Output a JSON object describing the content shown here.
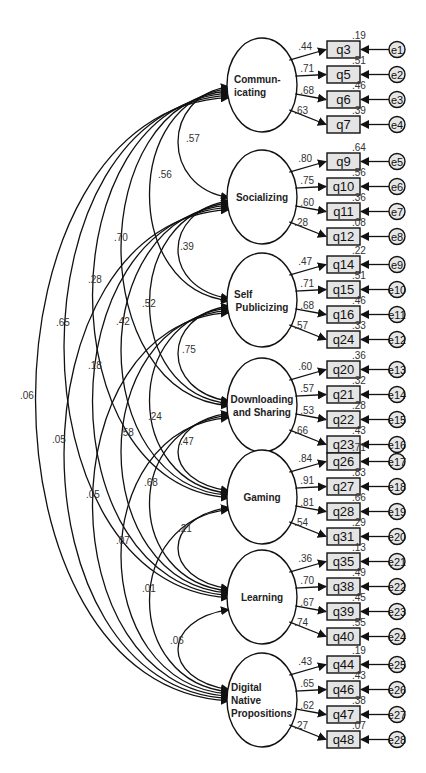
{
  "diagram": {
    "type": "confirmatory-factor-analysis-path-diagram",
    "factors": [
      {
        "id": "communicating",
        "label_lines": [
          "Commun-",
          "icating"
        ],
        "cy": 85,
        "items": [
          {
            "name": "q3",
            "loading": ".44",
            "r2": ".19",
            "error": "e1"
          },
          {
            "name": "q5",
            "loading": ".71",
            "r2": ".51",
            "error": "e2"
          },
          {
            "name": "q6",
            "loading": ".68",
            "r2": ".46",
            "error": "e3"
          },
          {
            "name": "q7",
            "loading": ".63",
            "r2": ".39",
            "error": "e4"
          }
        ]
      },
      {
        "id": "socializing",
        "label_lines": [
          "Socializing"
        ],
        "cy": 197,
        "items": [
          {
            "name": "q9",
            "loading": ".80",
            "r2": ".64",
            "error": "e5"
          },
          {
            "name": "q10",
            "loading": ".75",
            "r2": ".56",
            "error": "e6"
          },
          {
            "name": "q11",
            "loading": ".60",
            "r2": ".36",
            "error": "e7"
          },
          {
            "name": "q12",
            "loading": ".28",
            "r2": ".08",
            "error": "e8"
          }
        ]
      },
      {
        "id": "self-publicizing",
        "label_lines": [
          "Self",
          "Publicizing"
        ],
        "cy": 300,
        "items": [
          {
            "name": "q14",
            "loading": ".47",
            "r2": ".22",
            "error": "e9"
          },
          {
            "name": "q15",
            "loading": ".71",
            "r2": ".51",
            "error": "e10"
          },
          {
            "name": "q16",
            "loading": ".68",
            "r2": ".46",
            "error": "e11"
          },
          {
            "name": "q24",
            "loading": ".57",
            "r2": ".33",
            "error": "e12"
          }
        ]
      },
      {
        "id": "downloading-and-sharing",
        "label_lines": [
          "Downloading",
          "and Sharing"
        ],
        "cy": 405,
        "items": [
          {
            "name": "q20",
            "loading": ".60",
            "r2": ".36",
            "error": "e13"
          },
          {
            "name": "q21",
            "loading": ".57",
            "r2": ".32",
            "error": "e14"
          },
          {
            "name": "q22",
            "loading": ".53",
            "r2": ".28",
            "error": "e15"
          },
          {
            "name": "q23",
            "loading": ".66",
            "r2": ".43",
            "error": "e16"
          }
        ]
      },
      {
        "id": "gaming",
        "label_lines": [
          "Gaming"
        ],
        "cy": 497,
        "items": [
          {
            "name": "q26",
            "loading": ".84",
            "r2": ".71",
            "error": "e17"
          },
          {
            "name": "q27",
            "loading": ".91",
            "r2": ".83",
            "error": "e18"
          },
          {
            "name": "q28",
            "loading": ".81",
            "r2": ".66",
            "error": "e19"
          },
          {
            "name": "q31",
            "loading": ".54",
            "r2": ".29",
            "error": "e20"
          }
        ]
      },
      {
        "id": "learning",
        "label_lines": [
          "Learning"
        ],
        "cy": 597,
        "items": [
          {
            "name": "q35",
            "loading": ".36",
            "r2": ".13",
            "error": "e21"
          },
          {
            "name": "q38",
            "loading": ".70",
            "r2": ".49",
            "error": "e22"
          },
          {
            "name": "q39",
            "loading": ".67",
            "r2": ".45",
            "error": "e23"
          },
          {
            "name": "q40",
            "loading": ".74",
            "r2": ".55",
            "error": "e24"
          }
        ]
      },
      {
        "id": "digital-native-propositions",
        "label_lines": [
          "Digital",
          "Native",
          "Propositions"
        ],
        "cy": 700,
        "items": [
          {
            "name": "q44",
            "loading": ".43",
            "r2": ".19",
            "error": "e25"
          },
          {
            "name": "q46",
            "loading": ".65",
            "r2": ".43",
            "error": "e26"
          },
          {
            "name": "q47",
            "loading": ".62",
            "r2": ".38",
            "error": "e27"
          },
          {
            "name": "q48",
            "loading": ".27",
            "r2": ".07",
            "error": "e28"
          }
        ]
      }
    ],
    "correlations": [
      {
        "from": 0,
        "to": 1,
        "value": ".57",
        "lx": 186,
        "ly": 142
      },
      {
        "from": 0,
        "to": 2,
        "value": ".56",
        "lx": 158,
        "ly": 178
      },
      {
        "from": 1,
        "to": 2,
        "value": ".39",
        "lx": 180,
        "ly": 250
      },
      {
        "from": 0,
        "to": 3,
        "value": ".70",
        "lx": 114,
        "ly": 241
      },
      {
        "from": 1,
        "to": 3,
        "value": ".52",
        "lx": 142,
        "ly": 307
      },
      {
        "from": 2,
        "to": 3,
        "value": ".75",
        "lx": 182,
        "ly": 353
      },
      {
        "from": 0,
        "to": 4,
        "value": ".28",
        "lx": 88,
        "ly": 283
      },
      {
        "from": 1,
        "to": 4,
        "value": ".42",
        "lx": 116,
        "ly": 325
      },
      {
        "from": 2,
        "to": 4,
        "value": ".24",
        "lx": 148,
        "ly": 420
      },
      {
        "from": 3,
        "to": 4,
        "value": ".47",
        "lx": 180,
        "ly": 445
      },
      {
        "from": 0,
        "to": 5,
        "value": ".65",
        "lx": 56,
        "ly": 326
      },
      {
        "from": 1,
        "to": 5,
        "value": ".18",
        "lx": 88,
        "ly": 369
      },
      {
        "from": 2,
        "to": 5,
        "value": ".58",
        "lx": 120,
        "ly": 436
      },
      {
        "from": 3,
        "to": 5,
        "value": ".68",
        "lx": 144,
        "ly": 486
      },
      {
        "from": 4,
        "to": 5,
        "value": ".21",
        "lx": 178,
        "ly": 532
      },
      {
        "from": 0,
        "to": 6,
        "value": ".06",
        "lx": 20,
        "ly": 399
      },
      {
        "from": 1,
        "to": 6,
        "value": ".05",
        "lx": 52,
        "ly": 443
      },
      {
        "from": 2,
        "to": 6,
        "value": ".05",
        "lx": 86,
        "ly": 498
      },
      {
        "from": 3,
        "to": 6,
        "value": ".07",
        "lx": 116,
        "ly": 544
      },
      {
        "from": 4,
        "to": 6,
        "value": ".01",
        "lx": 142,
        "ly": 592
      },
      {
        "from": 5,
        "to": 6,
        "value": ".06",
        "lx": 170,
        "ly": 644
      }
    ]
  }
}
